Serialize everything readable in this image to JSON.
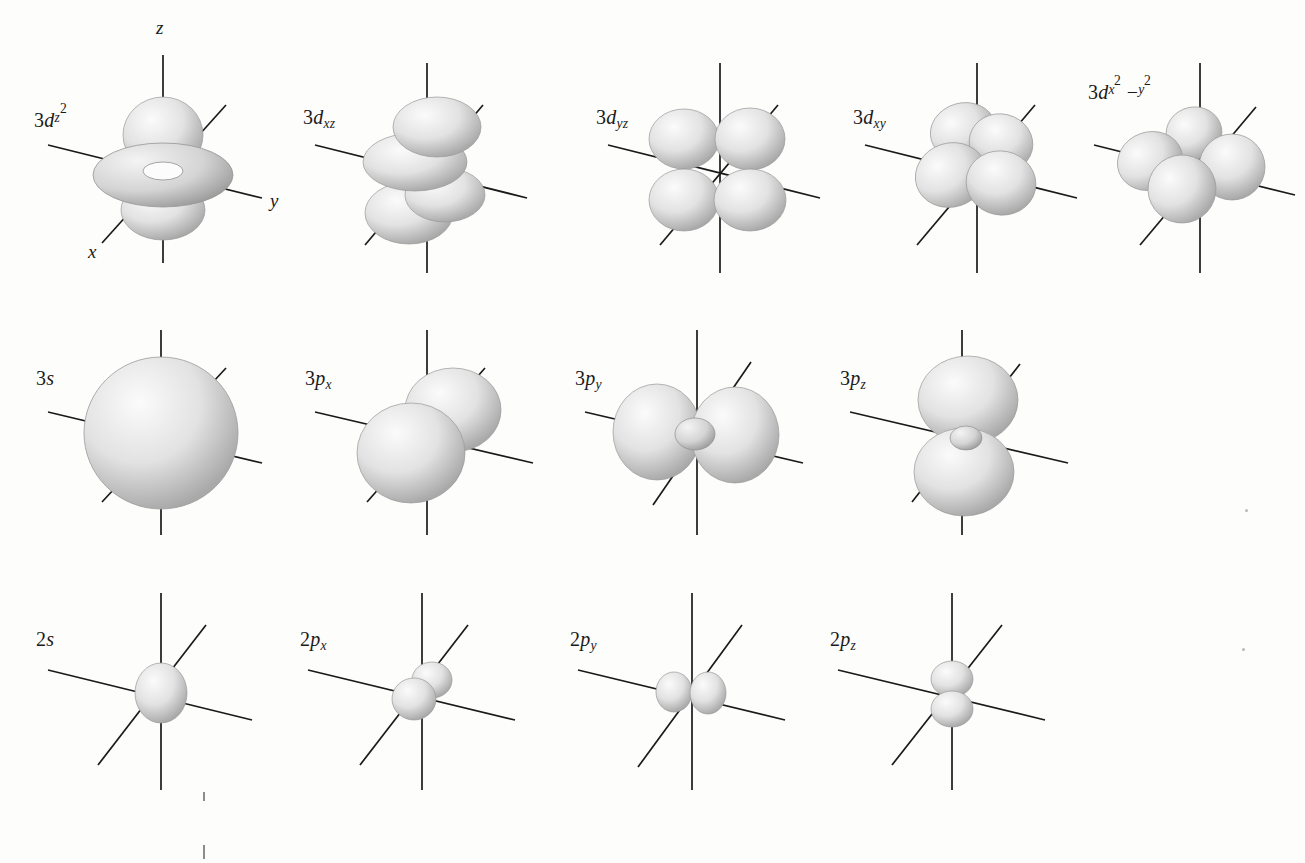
{
  "figure": {
    "background_color": "#fdfdfc",
    "axis_color": "#1a1a1a",
    "orbital_fill_light": "#f2f2f2",
    "orbital_fill_mid": "#d9d9d9",
    "orbital_fill_dark": "#a8a8a8",
    "axis_labels": {
      "z": "z",
      "y": "y",
      "x": "x"
    },
    "rows": [
      {
        "name": "3d-orbitals",
        "panels": [
          {
            "id": "3dz2",
            "label_parts": {
              "n": "3",
              "letter": "d",
              "sub": "z",
              "sup": "2"
            },
            "shape": "dz2",
            "show_axis_labels": true
          },
          {
            "id": "3dxz",
            "label_parts": {
              "n": "3",
              "letter": "d",
              "sub": "xz",
              "sup": ""
            },
            "shape": "dxz",
            "show_axis_labels": false
          },
          {
            "id": "3dyz",
            "label_parts": {
              "n": "3",
              "letter": "d",
              "sub": "yz",
              "sup": ""
            },
            "shape": "dyz",
            "show_axis_labels": false
          },
          {
            "id": "3dxy",
            "label_parts": {
              "n": "3",
              "letter": "d",
              "sub": "xy",
              "sup": ""
            },
            "shape": "dxy",
            "show_axis_labels": false
          },
          {
            "id": "3dx2y2",
            "label_parts": {
              "n": "3",
              "letter": "d",
              "sub": "x",
              "sup": "2",
              "tail_minus": "−",
              "sub2": "y",
              "sup2": "2"
            },
            "shape": "dx2y2",
            "show_axis_labels": false
          }
        ]
      },
      {
        "name": "3s-and-3p-orbitals",
        "panels": [
          {
            "id": "3s",
            "label_parts": {
              "n": "3",
              "letter": "s",
              "sub": "",
              "sup": ""
            },
            "shape": "s-large",
            "show_axis_labels": false
          },
          {
            "id": "3px",
            "label_parts": {
              "n": "3",
              "letter": "p",
              "sub": "x",
              "sup": ""
            },
            "shape": "px-large",
            "show_axis_labels": false
          },
          {
            "id": "3py",
            "label_parts": {
              "n": "3",
              "letter": "p",
              "sub": "y",
              "sup": ""
            },
            "shape": "py-large",
            "show_axis_labels": false
          },
          {
            "id": "3pz",
            "label_parts": {
              "n": "3",
              "letter": "p",
              "sub": "z",
              "sup": ""
            },
            "shape": "pz-large",
            "show_axis_labels": false
          }
        ]
      },
      {
        "name": "2s-and-2p-orbitals",
        "panels": [
          {
            "id": "2s",
            "label_parts": {
              "n": "2",
              "letter": "s",
              "sub": "",
              "sup": ""
            },
            "shape": "s-small",
            "show_axis_labels": false
          },
          {
            "id": "2px",
            "label_parts": {
              "n": "2",
              "letter": "p",
              "sub": "x",
              "sup": ""
            },
            "shape": "px-small",
            "show_axis_labels": false
          },
          {
            "id": "2py",
            "label_parts": {
              "n": "2",
              "letter": "p",
              "sub": "y",
              "sup": ""
            },
            "shape": "py-small",
            "show_axis_labels": false
          },
          {
            "id": "2pz",
            "label_parts": {
              "n": "2",
              "letter": "p",
              "sub": "z",
              "sup": ""
            },
            "shape": "pz-small",
            "show_axis_labels": false
          }
        ]
      }
    ]
  }
}
